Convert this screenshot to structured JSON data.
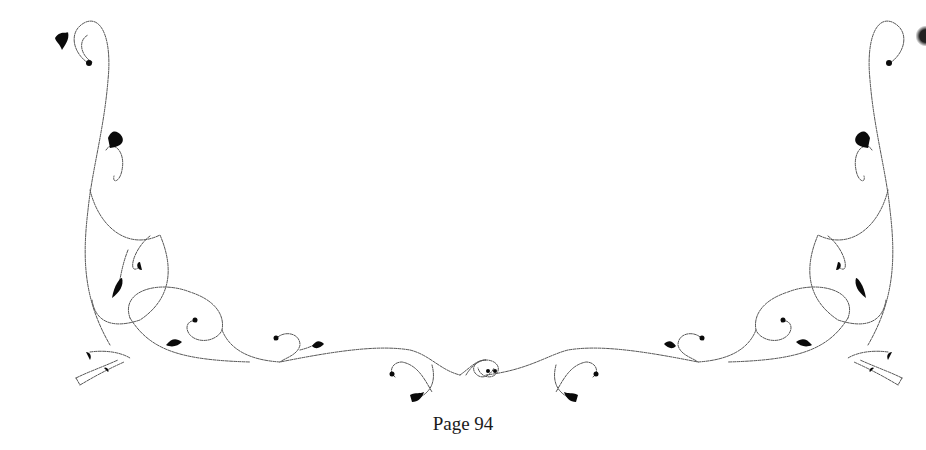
{
  "page": {
    "footer": {
      "page_number_label": "Page 94"
    },
    "decoration": {
      "type": "floral-scroll-ornament",
      "ink_color": "#0a0a0a",
      "line_color": "#555555",
      "background": "#ffffff"
    }
  }
}
